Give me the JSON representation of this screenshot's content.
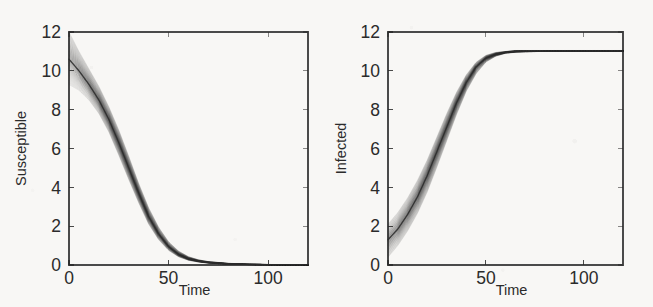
{
  "figure": {
    "name": "sir-ensemble-trajectories",
    "background_color": "#f8f7f5",
    "ink_color": "#2b2b2b",
    "panel_count": 2
  },
  "chart_data": [
    {
      "type": "line",
      "name": "susceptible-panel",
      "title": "",
      "xlabel": "Time",
      "ylabel": "Susceptible",
      "xlim": [
        0,
        120
      ],
      "ylim": [
        0,
        12
      ],
      "xticks": [
        0,
        50,
        100
      ],
      "xticklabels": [
        "0",
        "50",
        "100"
      ],
      "yticks": [
        0,
        2,
        4,
        6,
        8,
        10,
        12
      ],
      "yticklabels": [
        "0",
        "2",
        "4",
        "6",
        "8",
        "10",
        "12"
      ],
      "grid": false,
      "legend": false,
      "description": "Dense ensemble of stochastic trajectories forming a shaded band; starts spread between about 9.3 and 12 at t=0, decays sigmoidally to near 0 by t=70 and stays flat thereafter.",
      "series": [
        {
          "name": "ensemble-mean",
          "x": [
            0,
            5,
            10,
            15,
            20,
            25,
            30,
            35,
            40,
            45,
            50,
            55,
            60,
            65,
            70,
            80,
            90,
            100,
            110,
            120
          ],
          "values": [
            10.6,
            10.0,
            9.3,
            8.5,
            7.5,
            6.3,
            5.0,
            3.7,
            2.5,
            1.6,
            0.95,
            0.55,
            0.32,
            0.2,
            0.13,
            0.06,
            0.03,
            0.02,
            0.015,
            0.01
          ]
        },
        {
          "name": "ensemble-upper",
          "x": [
            0,
            5,
            10,
            15,
            20,
            25,
            30,
            35,
            40,
            45,
            50,
            55,
            60,
            65,
            70,
            80,
            90,
            100,
            110,
            120
          ],
          "values": [
            12.0,
            11.0,
            10.1,
            9.2,
            8.15,
            6.95,
            5.6,
            4.2,
            2.95,
            1.95,
            1.2,
            0.72,
            0.43,
            0.27,
            0.18,
            0.09,
            0.05,
            0.03,
            0.02,
            0.015
          ]
        },
        {
          "name": "ensemble-lower",
          "x": [
            0,
            5,
            10,
            15,
            20,
            25,
            30,
            35,
            40,
            45,
            50,
            55,
            60,
            65,
            70,
            80,
            90,
            100,
            110,
            120
          ],
          "values": [
            9.3,
            9.0,
            8.5,
            7.8,
            6.85,
            5.65,
            4.4,
            3.2,
            2.1,
            1.3,
            0.75,
            0.42,
            0.24,
            0.15,
            0.09,
            0.04,
            0.02,
            0.012,
            0.01,
            0.008
          ]
        }
      ]
    },
    {
      "type": "line",
      "name": "infected-panel",
      "title": "",
      "xlabel": "Time",
      "ylabel": "Infected",
      "xlim": [
        0,
        120
      ],
      "ylim": [
        0,
        12
      ],
      "xticks": [
        0,
        50,
        100
      ],
      "xticklabels": [
        "0",
        "50",
        "100"
      ],
      "yticks": [
        0,
        2,
        4,
        6,
        8,
        10,
        12
      ],
      "yticklabels": [
        "0",
        "2",
        "4",
        "6",
        "8",
        "10",
        "12"
      ],
      "grid": false,
      "legend": false,
      "description": "Dense ensemble of stochastic trajectories forming a shaded band; starts spread between about 0.4 and 2.1 at t=0, rises sigmoidally and saturates at about 11 from t=70 onward.",
      "series": [
        {
          "name": "ensemble-mean",
          "x": [
            0,
            5,
            10,
            15,
            20,
            25,
            30,
            35,
            40,
            45,
            50,
            55,
            60,
            65,
            70,
            80,
            90,
            100,
            110,
            120
          ],
          "values": [
            1.3,
            1.85,
            2.6,
            3.5,
            4.6,
            5.85,
            7.1,
            8.35,
            9.4,
            10.2,
            10.65,
            10.85,
            10.95,
            11.0,
            11.0,
            11.0,
            11.0,
            11.0,
            11.0,
            11.0
          ]
        },
        {
          "name": "ensemble-upper",
          "x": [
            0,
            5,
            10,
            15,
            20,
            25,
            30,
            35,
            40,
            45,
            50,
            55,
            60,
            65,
            70,
            80,
            90,
            100,
            110,
            120
          ],
          "values": [
            2.1,
            2.7,
            3.45,
            4.35,
            5.4,
            6.6,
            7.8,
            8.9,
            9.8,
            10.45,
            10.8,
            10.95,
            11.0,
            11.05,
            11.05,
            11.05,
            11.05,
            11.05,
            11.05,
            11.05
          ]
        },
        {
          "name": "ensemble-lower",
          "x": [
            0,
            5,
            10,
            15,
            20,
            25,
            30,
            35,
            40,
            45,
            50,
            55,
            60,
            65,
            70,
            80,
            90,
            100,
            110,
            120
          ],
          "values": [
            0.4,
            1.0,
            1.75,
            2.65,
            3.75,
            5.05,
            6.4,
            7.75,
            8.95,
            9.85,
            10.45,
            10.75,
            10.9,
            10.95,
            10.98,
            11.0,
            11.0,
            11.0,
            11.0,
            11.0
          ]
        }
      ]
    }
  ]
}
